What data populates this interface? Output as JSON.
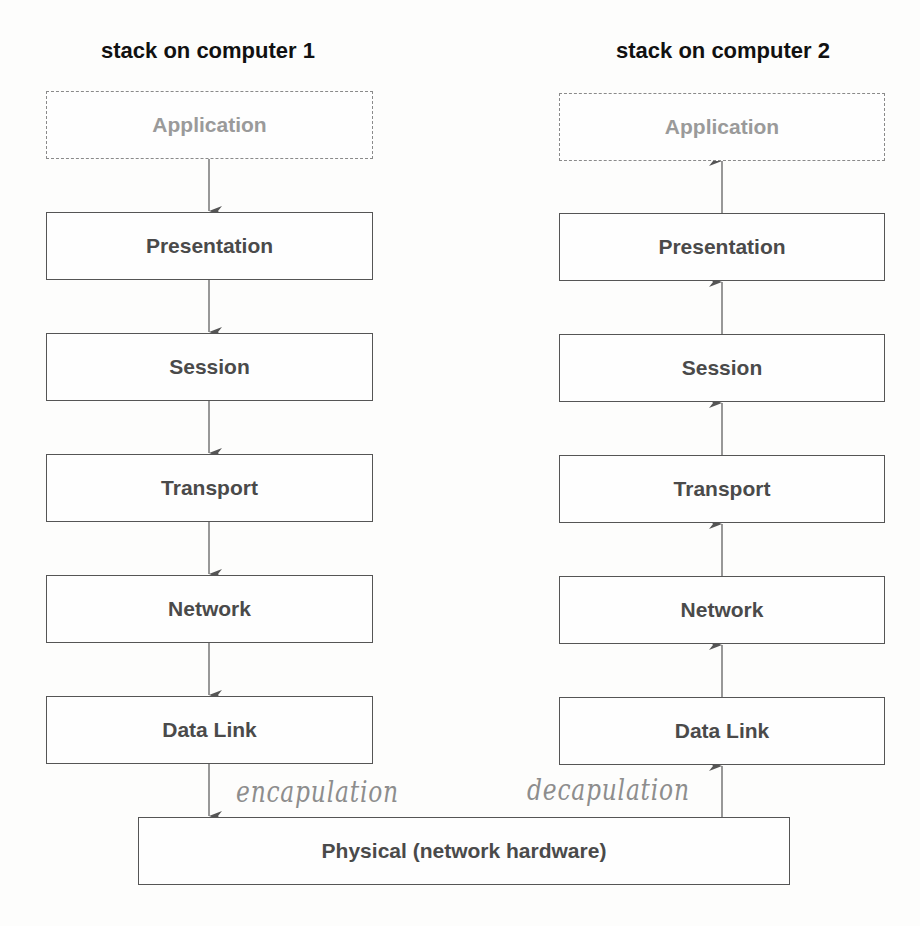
{
  "stacks": [
    {
      "heading": "stack on computer 1",
      "direction": "down",
      "layers": [
        {
          "label": "Application",
          "style": "dashed-faded"
        },
        {
          "label": "Presentation",
          "style": "solid"
        },
        {
          "label": "Session",
          "style": "solid"
        },
        {
          "label": "Transport",
          "style": "solid"
        },
        {
          "label": "Network",
          "style": "solid"
        },
        {
          "label": "Data Link",
          "style": "solid"
        }
      ]
    },
    {
      "heading": "stack on computer 2",
      "direction": "up",
      "layers": [
        {
          "label": "Application",
          "style": "dashed-faded"
        },
        {
          "label": "Presentation",
          "style": "solid"
        },
        {
          "label": "Session",
          "style": "solid"
        },
        {
          "label": "Transport",
          "style": "solid"
        },
        {
          "label": "Network",
          "style": "solid"
        },
        {
          "label": "Data Link",
          "style": "solid"
        }
      ]
    }
  ],
  "shared_layer": {
    "label": "Physical (network hardware)"
  },
  "annotations": {
    "left": "encapulation",
    "right": "decapulation"
  },
  "colors": {
    "box_border": "#555555",
    "faded_border": "#8a8a8a",
    "faded_text": "#9a9a9a",
    "box_text": "#4a4a4a",
    "handwriting": "#8d8d8d",
    "arrow": "#555555"
  }
}
